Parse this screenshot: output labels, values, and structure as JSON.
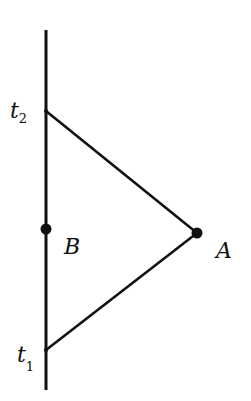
{
  "diagram": {
    "type": "spacetime-worldline",
    "labels": {
      "t2": {
        "base": "t",
        "sub": "2"
      },
      "t1": {
        "base": "t",
        "sub": "1"
      },
      "B": "B",
      "A": "A"
    },
    "colors": {
      "ink": "#111111",
      "background": "#ffffff"
    }
  }
}
